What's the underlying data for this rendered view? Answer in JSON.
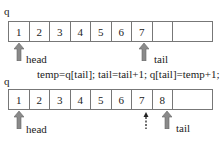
{
  "top": {
    "array_label": "q",
    "cells": [
      "1",
      "2",
      "3",
      "4",
      "5",
      "6",
      "7",
      "",
      ""
    ],
    "head_label": "head",
    "tail_label": "tail",
    "head_index": 0,
    "tail_index": 6
  },
  "code": "temp=q[tail]; tail=tail+1; q[tail]=temp+1;",
  "bottom": {
    "array_label": "q",
    "cells": [
      "1",
      "2",
      "3",
      "4",
      "5",
      "6",
      "7",
      "8",
      ""
    ],
    "head_label": "head",
    "tail_label": "tail",
    "head_index": 0,
    "old_tail_index": 6,
    "tail_index": 7
  },
  "colors": {
    "border": "#777777",
    "arrow": "#8a8a8a",
    "text": "#222222"
  }
}
